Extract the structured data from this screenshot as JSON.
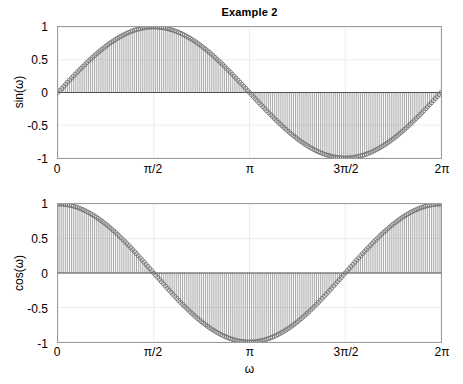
{
  "figure": {
    "title": "Example 2",
    "background_color": "#ffffff",
    "axis_color": "#9a9a9a",
    "grid_color": "#ededed",
    "stem_color": "#8c8c8c",
    "marker_edge_color": "#6b6b6b",
    "baseline_color": "#4d4d4d"
  },
  "xlabel": "ω",
  "xticks": [
    "0",
    "π/2",
    "π",
    "3π/2",
    "2π"
  ],
  "yticks": [
    "1",
    "0.5",
    "0",
    "-0.5",
    "-1"
  ],
  "chart_data": [
    {
      "type": "line",
      "style": "stem",
      "title": "Example 2",
      "ylabel": "sin(ω)",
      "xlabel": "",
      "xlim": [
        0,
        6.283185307179586
      ],
      "ylim": [
        -1,
        1
      ],
      "grid": true,
      "legend": "none",
      "xtick_values": [
        0,
        1.5707963267948966,
        3.141592653589793,
        4.71238898038469,
        6.283185307179586
      ],
      "xtick_labels": [
        "0",
        "π/2",
        "π",
        "3π/2",
        "2π"
      ],
      "ytick_values": [
        1,
        0.5,
        0,
        -0.5,
        -1
      ],
      "ytick_labels": [
        "1",
        "0.5",
        "0",
        "-0.5",
        "-1"
      ],
      "function": "sin(omega)",
      "n_points": 201,
      "x": [
        0.0,
        0.0314,
        0.0628,
        0.0942,
        0.1257,
        0.1571,
        0.1885,
        0.2199,
        0.2513,
        0.2827,
        0.3142,
        0.3456,
        0.377,
        0.4084,
        0.4398,
        0.4712,
        0.5027,
        0.5341,
        0.5655,
        0.5969,
        0.6283,
        0.6597,
        0.6912,
        0.7226,
        0.754,
        0.7854,
        0.8168,
        0.8482,
        0.8796,
        0.9111,
        0.9425,
        0.9739,
        1.0053,
        1.0367,
        1.0681,
        1.0996,
        1.131,
        1.1624,
        1.1938,
        1.2252,
        1.2566,
        1.2881,
        1.3195,
        1.3509,
        1.3823,
        1.4137,
        1.4451,
        1.4765,
        1.508,
        1.5394,
        1.5708,
        1.6022,
        1.6336,
        1.665,
        1.6965,
        1.7279,
        1.7593,
        1.7907,
        1.8221,
        1.8535,
        1.885,
        1.9164,
        1.9478,
        1.9792,
        2.0106,
        2.042,
        2.0735,
        2.1049,
        2.1363,
        2.1677,
        2.1991,
        2.2305,
        2.2619,
        2.2934,
        2.3248,
        2.3562,
        2.3876,
        2.419,
        2.4504,
        2.4819,
        2.5133,
        2.5447,
        2.5761,
        2.6075,
        2.6389,
        2.6704,
        2.7018,
        2.7332,
        2.7646,
        2.796,
        2.8274,
        2.8588,
        2.8903,
        2.9217,
        2.9531,
        2.9845,
        3.0159,
        3.0473,
        3.0788,
        3.1102,
        3.1416,
        3.173,
        3.2044,
        3.2358,
        3.2673,
        3.2987,
        3.3301,
        3.3615,
        3.3929,
        3.4243,
        3.4558,
        3.4872,
        3.5186,
        3.55,
        3.5814,
        3.6128,
        3.6442,
        3.6757,
        3.7071,
        3.7385,
        3.7699,
        3.8013,
        3.8327,
        3.8642,
        3.8956,
        3.927,
        3.9584,
        3.9898,
        4.0212,
        4.0527,
        4.0841,
        4.1155,
        4.1469,
        4.1783,
        4.2097,
        4.2412,
        4.2726,
        4.304,
        4.3354,
        4.3668,
        4.3982,
        4.4296,
        4.4611,
        4.4925,
        4.5239,
        4.5553,
        4.5867,
        4.6181,
        4.6496,
        4.681,
        4.7124,
        4.7438,
        4.7752,
        4.8066,
        4.8381,
        4.8695,
        4.9009,
        4.9323,
        4.9637,
        4.9951,
        5.0265,
        5.058,
        5.0894,
        5.1208,
        5.1522,
        5.1836,
        5.215,
        5.2465,
        5.2779,
        5.3093,
        5.3407,
        5.3721,
        5.4035,
        5.435,
        5.4664,
        5.4978,
        5.5292,
        5.5606,
        5.592,
        5.6235,
        5.6549,
        5.6863,
        5.7177,
        5.7491,
        5.7805,
        5.8119,
        5.8434,
        5.8748,
        5.9062,
        5.9376,
        5.969,
        6.0004,
        6.0319,
        6.0633,
        6.0947,
        6.1261,
        6.1575,
        6.1889,
        6.2204,
        6.2518,
        6.2832
      ],
      "y_formula": "y[i] = sin(x[i])"
    },
    {
      "type": "line",
      "style": "stem",
      "title": "",
      "ylabel": "cos(ω)",
      "xlabel": "ω",
      "xlim": [
        0,
        6.283185307179586
      ],
      "ylim": [
        -1,
        1
      ],
      "grid": true,
      "legend": "none",
      "xtick_values": [
        0,
        1.5707963267948966,
        3.141592653589793,
        4.71238898038469,
        6.283185307179586
      ],
      "xtick_labels": [
        "0",
        "π/2",
        "π",
        "3π/2",
        "2π"
      ],
      "ytick_values": [
        1,
        0.5,
        0,
        -0.5,
        -1
      ],
      "ytick_labels": [
        "1",
        "0.5",
        "0",
        "-0.5",
        "-1"
      ],
      "function": "cos(omega)",
      "n_points": 201,
      "y_formula": "y[i] = cos(x[i])"
    }
  ]
}
